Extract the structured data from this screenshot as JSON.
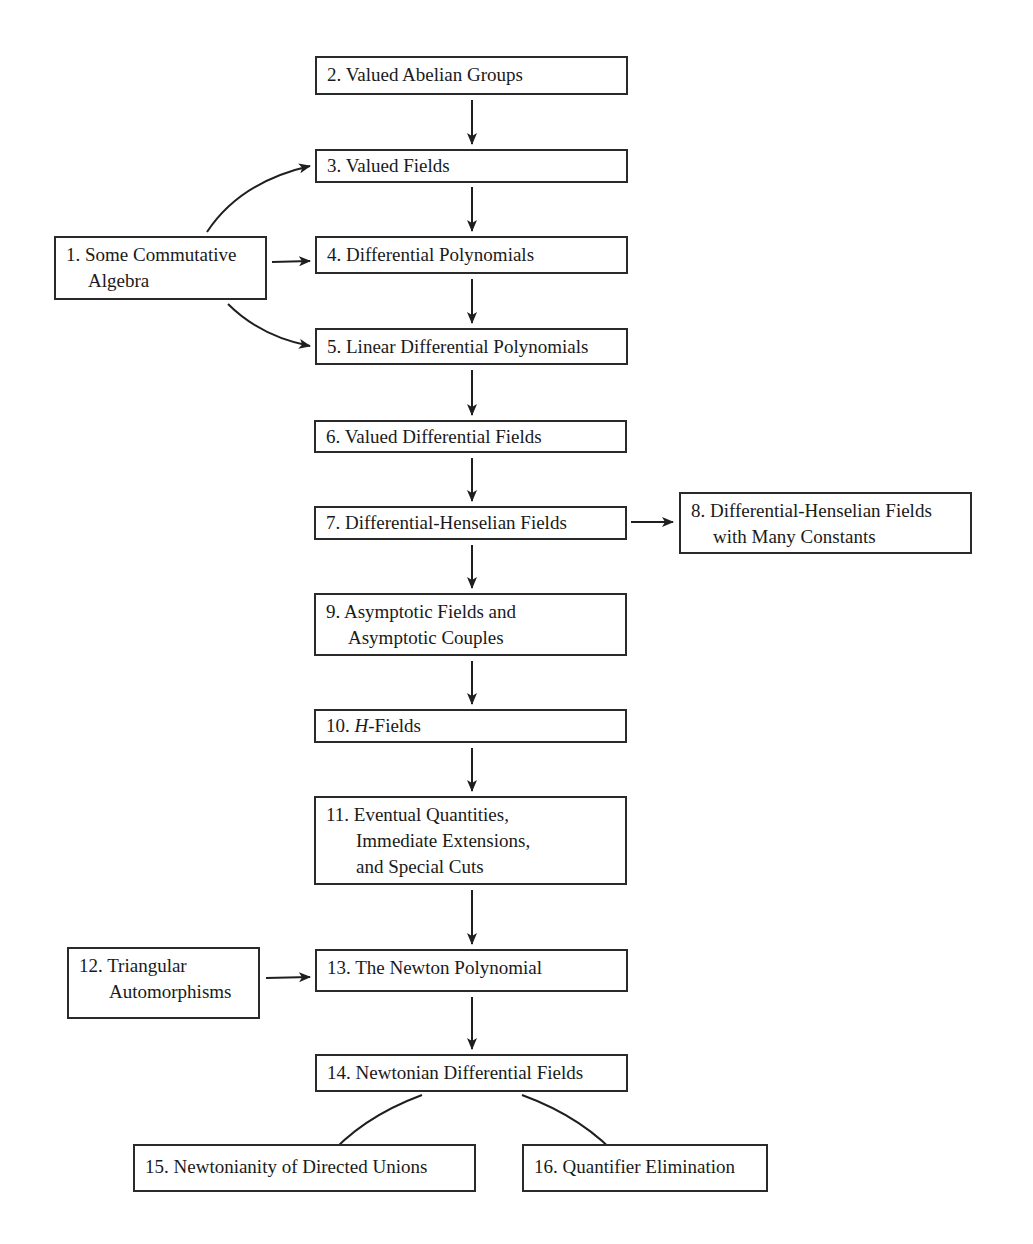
{
  "diagram": {
    "type": "chapter-dependency-flowchart",
    "nodes": [
      {
        "id": 1,
        "lines": [
          "1. Some Commutative",
          "Algebra"
        ]
      },
      {
        "id": 2,
        "lines": [
          "2. Valued Abelian Groups"
        ]
      },
      {
        "id": 3,
        "lines": [
          "3. Valued Fields"
        ]
      },
      {
        "id": 4,
        "lines": [
          "4. Differential Polynomials"
        ]
      },
      {
        "id": 5,
        "lines": [
          "5. Linear Differential Polynomials"
        ]
      },
      {
        "id": 6,
        "lines": [
          "6. Valued Differential Fields"
        ]
      },
      {
        "id": 7,
        "lines": [
          "7. Differential-Henselian Fields"
        ]
      },
      {
        "id": 8,
        "lines": [
          "8. Differential-Henselian Fields",
          "with Many Constants"
        ]
      },
      {
        "id": 9,
        "lines": [
          "9. Asymptotic Fields and",
          "Asymptotic Couples"
        ]
      },
      {
        "id": 10,
        "lines": [
          "10. ",
          "H",
          "-Fields"
        ]
      },
      {
        "id": 11,
        "lines": [
          "11. Eventual Quantities,",
          "Immediate Extensions,",
          "and Special Cuts"
        ]
      },
      {
        "id": 12,
        "lines": [
          "12. Triangular",
          "Automorphisms"
        ]
      },
      {
        "id": 13,
        "lines": [
          "13. The Newton Polynomial"
        ]
      },
      {
        "id": 14,
        "lines": [
          "14. Newtonian Differential Fields"
        ]
      },
      {
        "id": 15,
        "lines": [
          "15. Newtonianity of Directed Unions"
        ]
      },
      {
        "id": 16,
        "lines": [
          "16. Quantifier Elimination"
        ]
      }
    ],
    "edges": [
      {
        "from": 2,
        "to": 3,
        "style": "straight"
      },
      {
        "from": 1,
        "to": 3,
        "style": "curved"
      },
      {
        "from": 1,
        "to": 4,
        "style": "straight"
      },
      {
        "from": 1,
        "to": 5,
        "style": "curved"
      },
      {
        "from": 3,
        "to": 4,
        "style": "straight"
      },
      {
        "from": 4,
        "to": 5,
        "style": "straight"
      },
      {
        "from": 5,
        "to": 6,
        "style": "straight"
      },
      {
        "from": 6,
        "to": 7,
        "style": "straight"
      },
      {
        "from": 7,
        "to": 8,
        "style": "straight"
      },
      {
        "from": 7,
        "to": 9,
        "style": "straight"
      },
      {
        "from": 9,
        "to": 10,
        "style": "straight"
      },
      {
        "from": 10,
        "to": 11,
        "style": "straight"
      },
      {
        "from": 11,
        "to": 13,
        "style": "straight"
      },
      {
        "from": 12,
        "to": 13,
        "style": "straight"
      },
      {
        "from": 13,
        "to": 14,
        "style": "straight"
      },
      {
        "from": 14,
        "to": 15,
        "style": "curved"
      },
      {
        "from": 14,
        "to": 16,
        "style": "curved"
      }
    ]
  }
}
